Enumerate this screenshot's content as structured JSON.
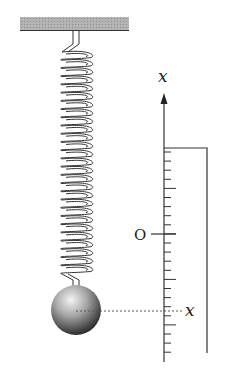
{
  "diagram": {
    "axis_label_top": "x",
    "origin_label": "O",
    "position_label": "x",
    "colors": {
      "ceiling": "#a9a9a9",
      "line": "#333333",
      "ball_light": "#f2f2f2",
      "ball_dark": "#3a3a3a"
    },
    "elements": [
      "ceiling",
      "spring",
      "mass",
      "vertical x-axis with ticks",
      "origin O",
      "dotted line to position x",
      "bracket line"
    ]
  }
}
